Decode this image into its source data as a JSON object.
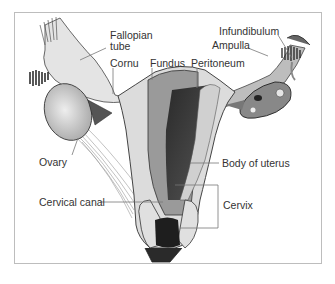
{
  "diagram": {
    "labels": {
      "fallopian_tube_1": "Fallopian",
      "fallopian_tube_2": "tube",
      "cornu": "Cornu",
      "fundus": "Fundus",
      "peritoneum": "Peritoneum",
      "infundibulum": "Infundibulum",
      "ampulla": "Ampulla",
      "ovary": "Ovary",
      "body_of_uterus": "Body of uterus",
      "cervical_canal": "Cervical canal",
      "cervix": "Cervix"
    },
    "colors": {
      "frame": "#bdbdbd",
      "tissue_light": "#dcdcdc",
      "tissue_mid": "#9a9a9a",
      "tissue_dark": "#3a3a3a",
      "leader_line": "#777777",
      "text": "#333333"
    }
  }
}
